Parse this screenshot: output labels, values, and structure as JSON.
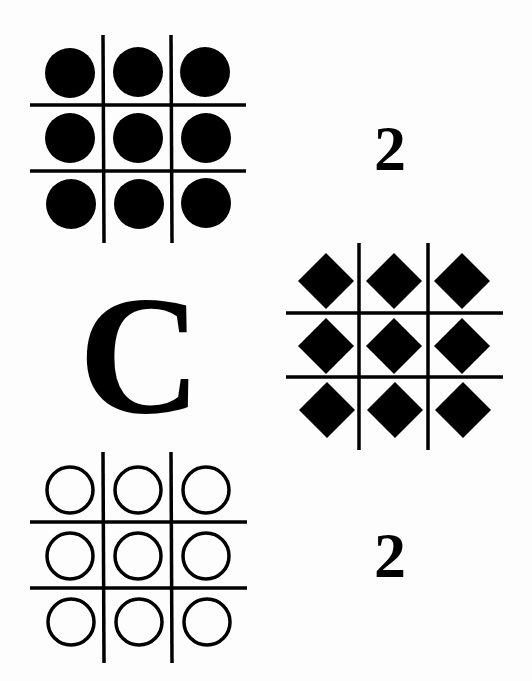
{
  "puzzle": {
    "panels": [
      {
        "id": "top-left",
        "shape": "filled-circle",
        "grid": "3x3",
        "count": 9
      },
      {
        "id": "middle-right",
        "shape": "filled-diamond",
        "grid": "3x3",
        "count": 9
      },
      {
        "id": "bottom-left",
        "shape": "outline-circle",
        "grid": "3x3",
        "count": 9
      }
    ],
    "labels": {
      "top_right": "2",
      "middle_left": "C",
      "bottom_right": "2"
    },
    "colors": {
      "ink": "#000000",
      "background": "#fdfdfd"
    }
  }
}
